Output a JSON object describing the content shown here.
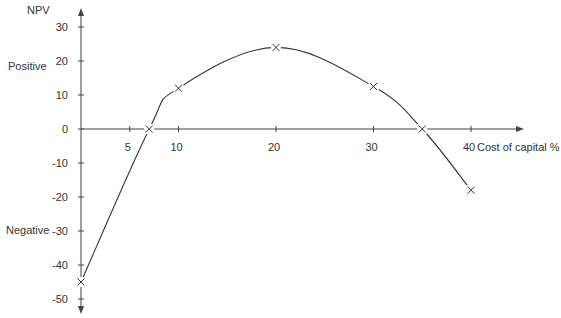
{
  "chart_data": {
    "type": "line",
    "title": "",
    "xlabel": "Cost of capital %",
    "ylabel": "NPV",
    "region_labels": {
      "positive": "Positive",
      "negative": "Negative"
    },
    "x_ticks": [
      5,
      10,
      20,
      30,
      40
    ],
    "y_ticks": [
      30,
      20,
      10,
      0,
      -10,
      -20,
      -30,
      -40,
      -50
    ],
    "xlim": [
      0,
      45
    ],
    "ylim": [
      -53,
      36
    ],
    "grid": false,
    "legend": null,
    "series": [
      {
        "name": "NPV",
        "marker": "x",
        "x": [
          0,
          7,
          10,
          20,
          30,
          35,
          40
        ],
        "y": [
          -45,
          0,
          12,
          24,
          12.5,
          0,
          -18
        ]
      }
    ],
    "annotations": [
      {
        "text": "IRR",
        "x": 7,
        "y": 0,
        "note": "first zero crossing (marker only, no label shown)"
      },
      {
        "text": "IRR",
        "x": 35,
        "y": 0,
        "note": "second zero crossing (marker only, no label shown)"
      }
    ]
  },
  "colors": {
    "axis": "#444444",
    "line": "#333333",
    "text": "#333333",
    "background": "#ffffff"
  }
}
